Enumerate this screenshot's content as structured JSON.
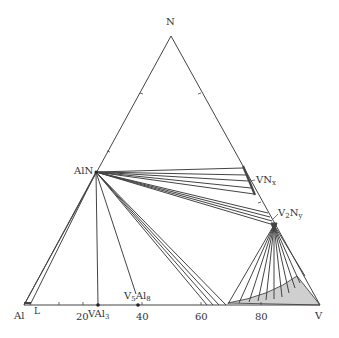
{
  "diagram": {
    "vertices": {
      "top": "N",
      "left": "Al",
      "right": "V"
    },
    "phases": {
      "AlN": "AlN",
      "VNx": {
        "base": "VN",
        "sub": "x"
      },
      "V2Ny": {
        "base": "V",
        "sub1": "2",
        "mid": "N",
        "sub2": "y"
      },
      "VAl3": {
        "base": "VAl",
        "sub": "3"
      },
      "V5Al8": {
        "base": "V",
        "sub1": "5",
        "mid": "Al",
        "sub2": "8"
      },
      "L": "L"
    },
    "axis_ticks": [
      "20",
      "40",
      "60",
      "80"
    ],
    "colors": {
      "line": "#444444",
      "shade": "#cfcfcf",
      "text": "#333333"
    }
  }
}
